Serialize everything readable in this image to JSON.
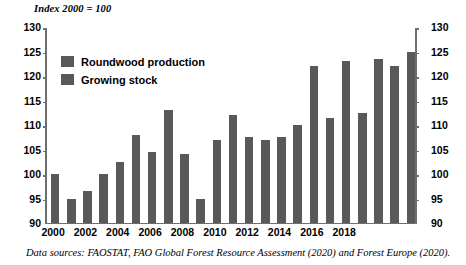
{
  "chart_data": {
    "type": "bar",
    "title": "Index 2000 = 100",
    "xlabel": "",
    "ylabel": "",
    "ylim": [
      90,
      130
    ],
    "yticks": [
      90,
      95,
      100,
      105,
      110,
      115,
      120,
      125,
      130
    ],
    "grid": false,
    "legend_position": "inside-top-left",
    "series": [
      {
        "name": "Roundwood production",
        "color": "#595959",
        "categories": [
          2000,
          2001,
          2002,
          2003,
          2004,
          2005,
          2006,
          2007,
          2008,
          2009,
          2010,
          2011,
          2012,
          2013,
          2014,
          2015,
          2016,
          2017,
          2018,
          2019
        ],
        "values": [
          100,
          95,
          96.5,
          100,
          102.5,
          108,
          104.5,
          113,
          104,
          95,
          107,
          112,
          107.5,
          107,
          107.5,
          110,
          122,
          111.5,
          123,
          112.5
        ]
      },
      {
        "name": "Growing stock",
        "color": "#595959",
        "categories": [
          2015,
          2016,
          2017,
          2018,
          2019
        ],
        "values": [
          110,
          122,
          111.5,
          123,
          112.5
        ]
      }
    ],
    "bars": [
      {
        "year": "2000",
        "value": 100
      },
      {
        "year": "2001",
        "value": 95
      },
      {
        "year": "2002",
        "value": 96.5
      },
      {
        "year": "2003",
        "value": 100
      },
      {
        "year": "2004",
        "value": 102.5
      },
      {
        "year": "2005",
        "value": 108
      },
      {
        "year": "2006",
        "value": 104.5
      },
      {
        "year": "2007",
        "value": 113
      },
      {
        "year": "2008",
        "value": 104
      },
      {
        "year": "2009",
        "value": 95
      },
      {
        "year": "2010",
        "value": 107
      },
      {
        "year": "2011",
        "value": 112
      },
      {
        "year": "2012",
        "value": 107.5
      },
      {
        "year": "2013",
        "value": 107
      },
      {
        "year": "2014",
        "value": 107.5
      },
      {
        "year": "2015",
        "value": 110
      },
      {
        "year": "2016",
        "value": 122
      },
      {
        "year": "2017",
        "value": 111.5
      },
      {
        "year": "2018",
        "value": 123
      },
      {
        "year": "2019",
        "value": 112.5
      },
      {
        "year": "2020",
        "value": 123.5
      },
      {
        "year": "2021",
        "value": 122
      },
      {
        "year": "2022",
        "value": 125
      }
    ],
    "xtick_labels": [
      "2000",
      "2002",
      "2004",
      "2006",
      "2008",
      "2010",
      "2012",
      "2014",
      "2016",
      "2018"
    ]
  },
  "legend": {
    "items": [
      {
        "label": "Roundwood production",
        "color": "#595959"
      },
      {
        "label": "Growing stock",
        "color": "#595959"
      }
    ]
  },
  "caption": {
    "text": "Data sources: FAOSTAT, FAO Global Forest Resource Assessment (2020) and Forest Europe (2020)."
  }
}
